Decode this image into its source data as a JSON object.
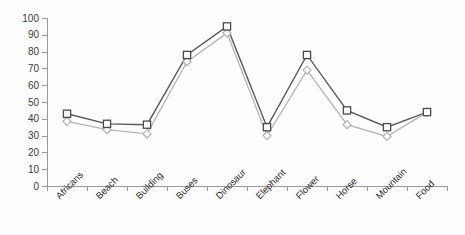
{
  "chart_data": {
    "type": "line",
    "title": "",
    "subtitle": "",
    "xlabel": "",
    "ylabel": "",
    "categories": [
      "Africans",
      "Beach",
      "Building",
      "Buses",
      "Dinosaur",
      "Elephant",
      "Flower",
      "Horse",
      "Mountain",
      "Food"
    ],
    "series": [
      {
        "name": "Series 1",
        "marker": "square",
        "color": "#595959",
        "values": [
          43,
          37,
          36.5,
          78,
          95,
          35,
          78,
          45,
          35,
          44
        ]
      },
      {
        "name": "Series 2",
        "marker": "diamond",
        "color": "#b4b4b4",
        "values": [
          38.5,
          33.5,
          31,
          74,
          91,
          30,
          69,
          36.5,
          29.5,
          44
        ]
      }
    ],
    "ylim": [
      0,
      100
    ],
    "ytick_step": 10,
    "yticks": [
      0,
      10,
      20,
      30,
      40,
      50,
      60,
      70,
      80,
      90,
      100
    ],
    "ytick_labels": [
      "0",
      "10",
      "20",
      "30",
      "40",
      "50",
      "60",
      "70",
      "80",
      "90",
      "100"
    ],
    "grid": false,
    "legend": false,
    "legend_position": "none",
    "xtick_label_rotation": -45
  }
}
